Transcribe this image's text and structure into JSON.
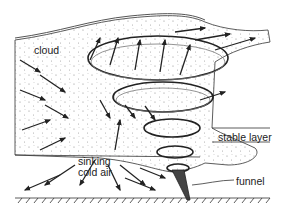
{
  "diagram": {
    "labels": {
      "cloud": "cloud",
      "stable_layer": "stable layer",
      "sinking_cold_air_line1": "sinking",
      "sinking_cold_air_line2": "cold air",
      "funnel": "funnel"
    },
    "colors": {
      "ink": "#222222",
      "background": "#ffffff",
      "stipple": "#888888"
    }
  }
}
